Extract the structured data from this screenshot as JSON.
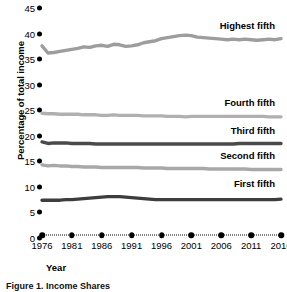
{
  "chart_data": {
    "type": "line",
    "title": "Figure 1. Income Shares",
    "xlabel": "Year",
    "ylabel": "Percentage of total income",
    "xlim": [
      1976,
      2016
    ],
    "ylim": [
      0,
      45
    ],
    "ytick_labels": [
      "0",
      "5",
      "10",
      "15",
      "20",
      "25",
      "30",
      "35",
      "40",
      "45"
    ],
    "ytick_values": [
      0,
      5,
      10,
      15,
      20,
      25,
      30,
      35,
      40,
      45
    ],
    "xtick_labels": [
      "1976",
      "1981",
      "1986",
      "1991",
      "1996",
      "2001",
      "2006",
      "2011",
      "2016"
    ],
    "xtick_values": [
      1976,
      1981,
      1986,
      1991,
      1996,
      2001,
      2006,
      2011,
      2016
    ],
    "grid": false,
    "legend_position": "inline-right",
    "x": [
      1976,
      1977,
      1978,
      1979,
      1980,
      1981,
      1982,
      1983,
      1984,
      1985,
      1986,
      1987,
      1988,
      1989,
      1990,
      1991,
      1992,
      1993,
      1994,
      1995,
      1996,
      1997,
      1998,
      1999,
      2000,
      2001,
      2002,
      2003,
      2004,
      2005,
      2006,
      2007,
      2008,
      2009,
      2010,
      2011,
      2012,
      2013,
      2014,
      2015,
      2016
    ],
    "series": [
      {
        "name": "Highest fifth",
        "color": "#9d9d9d",
        "label_x": 2014,
        "label_y": 41.6,
        "values": [
          37.6,
          36.2,
          36.3,
          36.5,
          36.7,
          36.9,
          37.1,
          37.4,
          37.3,
          37.6,
          37.7,
          37.5,
          37.9,
          37.8,
          37.5,
          37.6,
          37.8,
          38.2,
          38.4,
          38.6,
          39.0,
          39.2,
          39.4,
          39.6,
          39.7,
          39.6,
          39.3,
          39.2,
          39.1,
          39.0,
          38.9,
          38.8,
          38.9,
          38.8,
          38.9,
          38.8,
          38.7,
          38.8,
          38.9,
          38.8,
          39.0
        ]
      },
      {
        "name": "Fourth fifth",
        "color": "#b0b0b0",
        "label_x": 2014,
        "label_y": 26.6,
        "values": [
          24.4,
          24.3,
          24.3,
          24.2,
          24.2,
          24.2,
          24.2,
          24.1,
          24.1,
          24.1,
          24.0,
          24.0,
          24.1,
          24.0,
          24.0,
          24.0,
          24.0,
          23.9,
          23.9,
          23.9,
          23.9,
          23.8,
          23.8,
          23.8,
          23.7,
          23.8,
          23.8,
          23.8,
          23.8,
          23.8,
          23.8,
          23.8,
          23.8,
          23.8,
          23.8,
          23.8,
          23.8,
          23.8,
          23.7,
          23.7,
          23.7
        ]
      },
      {
        "name": "Third fifth",
        "color": "#4a4a4a",
        "label_x": 2014,
        "label_y": 21.1,
        "values": [
          18.8,
          18.5,
          18.6,
          18.6,
          18.6,
          18.5,
          18.5,
          18.5,
          18.5,
          18.4,
          18.4,
          18.4,
          18.4,
          18.4,
          18.4,
          18.4,
          18.4,
          18.4,
          18.4,
          18.4,
          18.4,
          18.4,
          18.4,
          18.4,
          18.4,
          18.4,
          18.4,
          18.4,
          18.4,
          18.4,
          18.4,
          18.4,
          18.4,
          18.5,
          18.5,
          18.5,
          18.5,
          18.5,
          18.5,
          18.5,
          18.5
        ]
      },
      {
        "name": "Second fifth",
        "color": "#a8a8a8",
        "label_x": 2014,
        "label_y": 16.2,
        "values": [
          14.3,
          14.1,
          14.2,
          14.1,
          14.1,
          14.0,
          14.0,
          13.9,
          13.9,
          13.9,
          13.8,
          13.8,
          13.8,
          13.8,
          13.8,
          13.8,
          13.8,
          13.7,
          13.7,
          13.7,
          13.7,
          13.6,
          13.6,
          13.6,
          13.6,
          13.6,
          13.6,
          13.6,
          13.5,
          13.5,
          13.5,
          13.5,
          13.5,
          13.5,
          13.5,
          13.4,
          13.4,
          13.4,
          13.4,
          13.4,
          13.4
        ]
      },
      {
        "name": "First fifth",
        "color": "#3d3d3d",
        "label_x": 2014,
        "label_y": 10.8,
        "values": [
          7.4,
          7.4,
          7.4,
          7.4,
          7.5,
          7.5,
          7.6,
          7.7,
          7.8,
          7.9,
          8.0,
          8.1,
          8.1,
          8.1,
          8.0,
          7.9,
          7.8,
          7.7,
          7.6,
          7.5,
          7.5,
          7.5,
          7.5,
          7.5,
          7.5,
          7.5,
          7.5,
          7.5,
          7.5,
          7.5,
          7.5,
          7.5,
          7.5,
          7.5,
          7.5,
          7.5,
          7.5,
          7.5,
          7.5,
          7.5,
          7.6
        ]
      }
    ]
  }
}
